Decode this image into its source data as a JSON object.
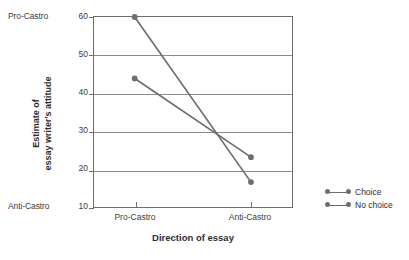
{
  "chart_data": {
    "type": "line",
    "title": "",
    "xlabel": "Direction of essay",
    "ylabel": "Estimate of\nessay writer's attitude",
    "categories": [
      "Pro-Castro",
      "Anti-Castro"
    ],
    "x": [
      0,
      1
    ],
    "xlim": [
      -0.35,
      1.37
    ],
    "ylim": [
      10,
      60
    ],
    "yticks": [
      10,
      20,
      30,
      40,
      50,
      60
    ],
    "ytick_labels": [
      "10",
      "20",
      "30",
      "40",
      "50",
      "60"
    ],
    "y_axis_end_labels": {
      "top": "Pro-Castro",
      "bottom": "Anti-Castro"
    },
    "grid": true,
    "grid_axis": "y",
    "legend_position": "right",
    "series": [
      {
        "name": "Choice",
        "values": [
          60,
          17
        ],
        "color": "#6e6e6e",
        "marker": "circle"
      },
      {
        "name": "No choice",
        "values": [
          44,
          23.5
        ],
        "color": "#6e6e6e",
        "marker": "circle"
      }
    ],
    "colors": {
      "line": "#6e6e6e",
      "axis": "#6d6d6d",
      "grid": "#8c8c8c",
      "text": "#2e2e2e",
      "tick_text": "#3b3b3b",
      "background": "#ffffff"
    }
  },
  "axis": {
    "y_end_top": "Pro-Castro",
    "y_end_bottom": "Anti-Castro",
    "y_title": "Estimate of\nessay writer's attitude",
    "x_title": "Direction of essay",
    "y_ticks": [
      "60",
      "50",
      "40",
      "30",
      "20",
      "10"
    ],
    "x_ticks": [
      "Pro-Castro",
      "Anti-Castro"
    ]
  },
  "legend": {
    "items": [
      {
        "label": "Choice"
      },
      {
        "label": "No choice"
      }
    ]
  }
}
